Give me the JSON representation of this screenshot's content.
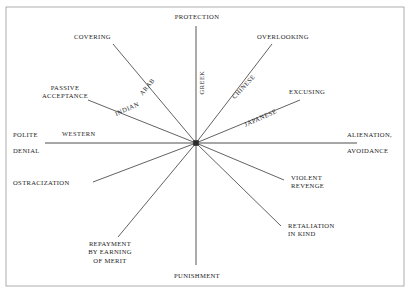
{
  "figure": {
    "center": {
      "x": 196,
      "y": 143
    },
    "line_color": "#3a3a3a",
    "text_color": "#1b1b1b",
    "background": "#ffffff",
    "border_color": "#6f6f6f"
  },
  "axis_labels": {
    "top": "PROTECTION",
    "bottom": "PUNISHMENT",
    "left_line1": "POLITE",
    "left_line2": "DENIAL",
    "right_line1": "ALIENATION,",
    "right_line2": "AVOIDANCE"
  },
  "outcomes": [
    {
      "id": "covering",
      "label": "COVERING"
    },
    {
      "id": "overlooking",
      "label": "OVERLOOKING"
    },
    {
      "id": "passive-acceptance",
      "label": "PASSIVE\nACCEPTANCE"
    },
    {
      "id": "excusing",
      "label": "EXCUSING"
    },
    {
      "id": "ostracization",
      "label": "OSTRACIZATION"
    },
    {
      "id": "violent-revenge",
      "label": "VIOLENT\nREVENGE"
    },
    {
      "id": "repayment",
      "label": "REPAYMENT\nBY EARNING\nOF MERIT"
    },
    {
      "id": "retaliation",
      "label": "RETALIATION\nIN KIND"
    }
  ],
  "cultures": [
    {
      "id": "arab",
      "label": "ARAB"
    },
    {
      "id": "greek",
      "label": "GREEK"
    },
    {
      "id": "chinese",
      "label": "CHINESE"
    },
    {
      "id": "japanese",
      "label": "JAPANESE"
    },
    {
      "id": "indian",
      "label": "INDIAN"
    },
    {
      "id": "western",
      "label": "WESTERN"
    }
  ]
}
